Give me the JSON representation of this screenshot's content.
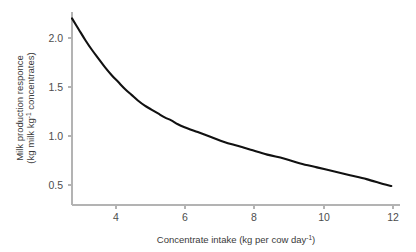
{
  "chart_data": {
    "type": "line",
    "title": "",
    "subtitle": "",
    "xlabel": "Concentrate intake (kg per cow day",
    "xlabel_sup": "-1",
    "xlabel_tail": ")",
    "ylabel_line1": "Milk production responce",
    "ylabel_line2_a": "(kg milk kg",
    "ylabel_line2_sup": "-1",
    "ylabel_line2_b": " concentrates)",
    "xlim": [
      2.6,
      12.3
    ],
    "ylim": [
      0.33,
      2.28
    ],
    "xticks": [
      4,
      6,
      8,
      10,
      12
    ],
    "xtick_labels": [
      "4",
      "6",
      "8",
      "10",
      "12"
    ],
    "yticks": [
      0.5,
      1.0,
      1.5,
      2.0
    ],
    "ytick_labels": [
      "0.5",
      "1.0",
      "1.5",
      "2.0"
    ],
    "grid": false,
    "legend": false,
    "legend_position": "none",
    "line_color": "#111111",
    "axis_color": "#b3b3b3",
    "tick_label_color": "#4d4d4d",
    "axis_title_color": "#3a3a3a",
    "series": [
      {
        "name": "Milk production response",
        "x": [
          2.6,
          2.8,
          3.0,
          3.2,
          3.4,
          3.6,
          3.8,
          4.0,
          4.2,
          4.4,
          4.6,
          4.8,
          5.0,
          5.2,
          5.4,
          5.6,
          5.8,
          6.0,
          6.4,
          6.8,
          7.2,
          7.6,
          8.0,
          8.5,
          9.0,
          9.5,
          10.0,
          10.5,
          11.0,
          11.5,
          12.0,
          12.25
        ],
        "y": [
          2.2,
          2.09,
          1.98,
          1.88,
          1.79,
          1.7,
          1.62,
          1.55,
          1.48,
          1.42,
          1.36,
          1.31,
          1.27,
          1.23,
          1.19,
          1.16,
          1.12,
          1.09,
          1.04,
          0.99,
          0.94,
          0.9,
          0.86,
          0.81,
          0.77,
          0.72,
          0.68,
          0.64,
          0.6,
          0.56,
          0.51,
          0.49
        ]
      }
    ],
    "annotations": []
  },
  "geometry": {
    "plot_left": 72,
    "plot_right": 400,
    "plot_top": 12,
    "plot_bottom": 205,
    "x_data_left": 72,
    "x_data_right": 393,
    "y_tick_05": 185,
    "y_tick_20": 38
  }
}
